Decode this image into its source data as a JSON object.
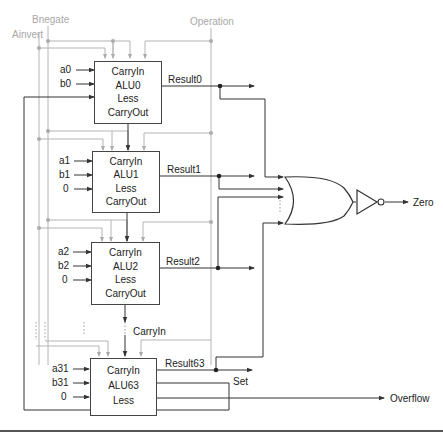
{
  "control_signals": {
    "binvert": "Bnegate",
    "ainvert": "Ainvert",
    "operation": "Operation"
  },
  "alus": [
    {
      "name": "ALU0",
      "ports": [
        "CarryIn",
        "ALU0",
        "Less",
        "CarryOut"
      ],
      "inputs": [
        "a0",
        "b0"
      ],
      "less_source": "feedback (Set)",
      "result": "Result0"
    },
    {
      "name": "ALU1",
      "ports": [
        "CarryIn",
        "ALU1",
        "Less",
        "CarryOut"
      ],
      "inputs": [
        "a1",
        "b1",
        "0"
      ],
      "result": "Result1"
    },
    {
      "name": "ALU2",
      "ports": [
        "CarryIn",
        "ALU2",
        "Less",
        "CarryOut"
      ],
      "inputs": [
        "a2",
        "b2",
        "0"
      ],
      "result": "Result2"
    },
    {
      "name": "ALU63",
      "ports": [
        "CarryIn",
        "ALU63",
        "Less"
      ],
      "inputs": [
        "a31",
        "b31",
        "0"
      ],
      "result": "Result63"
    }
  ],
  "carryin_label": "CarryIn",
  "outputs": {
    "zero": "Zero",
    "set": "Set",
    "overflow": "Overflow"
  },
  "ellipsis": "⋮",
  "colors": {
    "wire": "#333333",
    "control_wire": "#b0b0b0",
    "control_text": "#a8a8a8"
  }
}
